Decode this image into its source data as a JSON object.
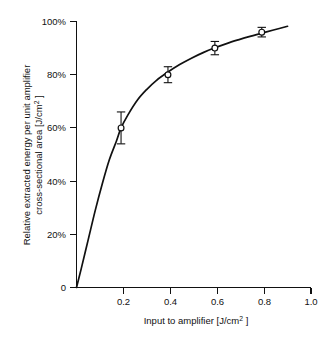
{
  "figure": {
    "background_color": "#ffffff",
    "ink_color": "#111111"
  },
  "chart_data": {
    "type": "line",
    "title": "",
    "subtitle": "",
    "xlabel": "Input to amplifier [J/cm2]",
    "xlabel_main": "Input to amplifier  [J/cm",
    "xlabel_sup": "2",
    "xlabel_tail": " ]",
    "ylabel": "Relative extracted energy per unit amplifier cross-sectional area [J/cm2]",
    "ylabel_line1": "Relative extracted energy per unit amplifier",
    "ylabel_line2_main": "cross-sectional area  [J/cm",
    "ylabel_line2_sup": "2",
    "ylabel_line2_tail": " ]",
    "xlim": [
      0,
      1.0
    ],
    "ylim": [
      0,
      100
    ],
    "xticks": [
      0.2,
      0.4,
      0.6,
      0.8,
      1.0
    ],
    "xtick_labels": [
      "0.2",
      "0.4",
      "0.6",
      "0.8",
      "1.0"
    ],
    "yticks": [
      0,
      20,
      40,
      60,
      80,
      100
    ],
    "ytick_labels": [
      "0",
      "20%",
      "40%",
      "60%",
      "80%",
      "100%"
    ],
    "grid": false,
    "legend": null,
    "legend_position": "none",
    "marker_style": "open-circle",
    "line_color": "#111111",
    "series": [
      {
        "name": "Relative extracted energy",
        "x": [
          0.19,
          0.39,
          0.59,
          0.79
        ],
        "values": [
          60,
          80,
          90,
          96
        ],
        "yerr": [
          6,
          3,
          2.5,
          1.8
        ]
      }
    ],
    "fit_curve": {
      "description": "Saturation curve through origin rising to ~99% at x=0.9",
      "x": [
        0.0,
        0.02,
        0.05,
        0.08,
        0.11,
        0.14,
        0.17,
        0.19,
        0.22,
        0.26,
        0.3,
        0.34,
        0.39,
        0.44,
        0.49,
        0.54,
        0.59,
        0.64,
        0.69,
        0.74,
        0.79,
        0.84,
        0.9
      ],
      "y": [
        0,
        7,
        18,
        29,
        39,
        48,
        55,
        60,
        65,
        70.5,
        74.5,
        77.8,
        81,
        83.8,
        86.2,
        88.3,
        90.1,
        91.7,
        93.1,
        94.4,
        95.6,
        96.8,
        98.2
      ]
    }
  }
}
